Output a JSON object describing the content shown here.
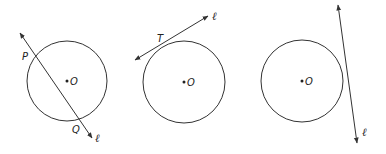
{
  "diagram": {
    "stroke_color": "#333333",
    "panels": [
      {
        "name": "secant",
        "circle": {
          "cx": 67,
          "cy": 81,
          "r": 40
        },
        "center_label": "O",
        "line": {
          "x1": 20,
          "y1": 33,
          "x2": 92,
          "y2": 138,
          "arrows": "both"
        },
        "line_label": "ℓ",
        "points": [
          {
            "label": "P",
            "x": 35,
            "y": 58,
            "label_x": 22,
            "label_y": 60
          },
          {
            "label": "Q",
            "x": 79,
            "y": 122,
            "label_x": 72,
            "label_y": 133
          }
        ]
      },
      {
        "name": "tangent",
        "circle": {
          "cx": 184,
          "cy": 82,
          "r": 41
        },
        "center_label": "O",
        "line": {
          "x1": 135,
          "y1": 60,
          "x2": 208,
          "y2": 16,
          "arrows": "both"
        },
        "line_label": "ℓ",
        "points": [
          {
            "label": "T",
            "x": 163,
            "y": 47,
            "label_x": 157,
            "label_y": 42
          }
        ]
      },
      {
        "name": "no-intersection",
        "circle": {
          "cx": 302,
          "cy": 81,
          "r": 41
        },
        "center_label": "O",
        "line": {
          "x1": 338,
          "y1": 5,
          "x2": 357,
          "y2": 143,
          "arrows": "both"
        },
        "line_label": "ℓ",
        "points": []
      }
    ]
  }
}
